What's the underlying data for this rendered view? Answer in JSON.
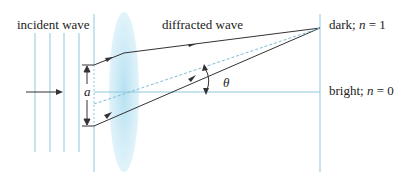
{
  "labels": {
    "incident": "incident wave",
    "diffracted": "diffracted wave",
    "dark_prefix": "dark; ",
    "dark_var": "n",
    "dark_suffix": " = 1",
    "bright_prefix": "bright; ",
    "bright_var": "n",
    "bright_suffix": " = 0",
    "slit_width": "a",
    "angle": "θ"
  },
  "colors": {
    "wave_lines": "#8fc9dd",
    "lens": "#a8dbef",
    "rays": "#333333",
    "dashed": "#7fbcd6",
    "text": "#222222"
  }
}
